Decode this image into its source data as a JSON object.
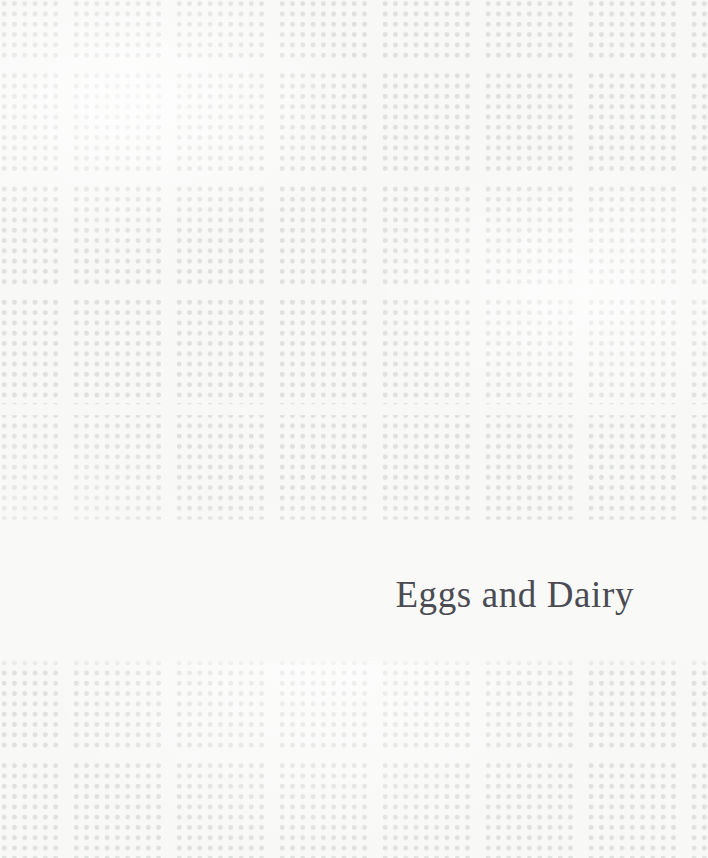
{
  "page": {
    "width": 708,
    "height": 858,
    "kind": "book-chapter-opener",
    "background_color": "#f8f9f7"
  },
  "title_band": {
    "top": 530,
    "height": 128,
    "background_color": "#f9faf8",
    "align": "right"
  },
  "chapter": {
    "title": "Eggs and Dairy",
    "text_color": "#4b4b53",
    "font_style": "serif",
    "font_size_px": 37,
    "baseline_y": 600,
    "right_edge_x": 634
  },
  "pattern": {
    "name": "dotted-grid-blocks",
    "dot_color": "#dee1dd",
    "dot_diameter_px": 5,
    "dot_pitch_px": 10.3,
    "block_width_px": 103,
    "block_height_px": 115,
    "gutter_color": "#f8f9f7",
    "gutter_width_px": 10,
    "gutter_height_px": 11,
    "vertical_gutter_positions_x": [
      62,
      165,
      268,
      372,
      475,
      578,
      681
    ],
    "horizontal_gutter_positions_y": [
      58,
      173,
      289,
      404,
      520,
      750
    ]
  }
}
